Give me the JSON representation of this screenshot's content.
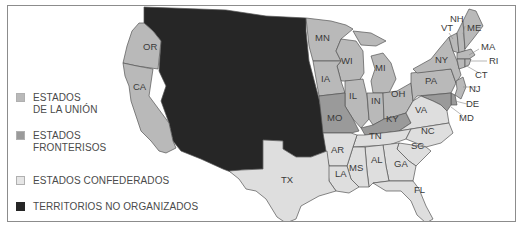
{
  "colors": {
    "union": "#b9b9b9",
    "border_states": "#9a9a9a",
    "confederate": "#dedede",
    "territories": "#262626",
    "state_outline": "#555555",
    "frame": "#8c8c8c"
  },
  "legend": {
    "items": [
      {
        "key": "union",
        "line1": "ESTADOS",
        "line2": "DE LA UNIÓN",
        "color": "#b9b9b9"
      },
      {
        "key": "border_states",
        "line1": "ESTADOS",
        "line2": "FRONTERISOS",
        "color": "#9a9a9a"
      },
      {
        "key": "confederate",
        "line1": "ESTADOS CONFEDERADOS",
        "line2": "",
        "color": "#dedede"
      },
      {
        "key": "territories",
        "line1": "TERRITORIOS NO ORGANIZADOS",
        "line2": "",
        "color": "#262626"
      }
    ]
  },
  "states": {
    "union": [
      "OR",
      "CA",
      "MN",
      "WI",
      "IA",
      "IL",
      "MI",
      "IN",
      "OH",
      "PA",
      "NY",
      "VT",
      "NH",
      "ME",
      "MA",
      "RI",
      "CT",
      "NJ"
    ],
    "border": [
      "MO",
      "KY",
      "DE",
      "MD"
    ],
    "confederate": [
      "TX",
      "AR",
      "LA",
      "MS",
      "AL",
      "GA",
      "FL",
      "TN",
      "SC",
      "NC",
      "VA"
    ]
  },
  "labels": {
    "OR": "OR",
    "CA": "CA",
    "MN": "MN",
    "WI": "WI",
    "IA": "IA",
    "IL": "IL",
    "MI": "MI",
    "IN": "IN",
    "OH": "OH",
    "PA": "PA",
    "NY": "NY",
    "VT": "VT",
    "NH": "NH",
    "ME": "ME",
    "MA": "MA",
    "RI": "RI",
    "CT": "CT",
    "NJ": "NJ",
    "DE": "DE",
    "MD": "MD",
    "MO": "MO",
    "KY": "KY",
    "VA": "VA",
    "TN": "TN",
    "NC": "NC",
    "SC": "SC",
    "AR": "AR",
    "LA": "LA",
    "MS": "MS",
    "AL": "AL",
    "GA": "GA",
    "FL": "FL",
    "TX": "TX"
  }
}
